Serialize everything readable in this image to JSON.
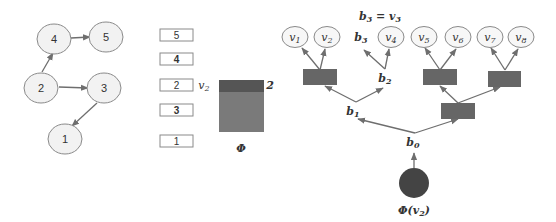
{
  "graph": {
    "nodes": [
      {
        "id": "1",
        "label": "1"
      },
      {
        "id": "2",
        "label": "2"
      },
      {
        "id": "3",
        "label": "3"
      },
      {
        "id": "4",
        "label": "4"
      },
      {
        "id": "5",
        "label": "5"
      }
    ],
    "edges": [
      {
        "from": "2",
        "to": "4"
      },
      {
        "from": "4",
        "to": "5"
      },
      {
        "from": "2",
        "to": "3"
      },
      {
        "from": "3",
        "to": "1"
      }
    ]
  },
  "stack": {
    "items": [
      "5",
      "4",
      "2",
      "3",
      "1"
    ],
    "bold_items": [
      "4",
      "3"
    ]
  },
  "embedding": {
    "row_label": "v2",
    "row_label_sub": "2",
    "row_index": "2",
    "matrix_label": "Φ",
    "colors": {
      "highlight_row": "#555555",
      "matrix": "#7a7a7a"
    }
  },
  "tree": {
    "annotation": "b3 = v3",
    "annotation_parts": {
      "lhs": "b",
      "lhs_sub": "3",
      "eq": " = ",
      "rhs": "v",
      "rhs_sub": "3"
    },
    "leaves": [
      {
        "label": "v",
        "sub": "1"
      },
      {
        "label": "v",
        "sub": "2"
      },
      {
        "label": "b",
        "sub": "3",
        "oval": false
      },
      {
        "label": "v",
        "sub": "4"
      },
      {
        "label": "v",
        "sub": "5"
      },
      {
        "label": "v",
        "sub": "6"
      },
      {
        "label": "v",
        "sub": "7"
      },
      {
        "label": "v",
        "sub": "8"
      }
    ],
    "branch_labels": [
      {
        "label": "b",
        "sub": "2"
      },
      {
        "label": "b",
        "sub": "1"
      },
      {
        "label": "b",
        "sub": "0"
      }
    ],
    "root_label": "Φ(v2)",
    "root_label_parts": {
      "phi": "Φ",
      "open": "(",
      "v": "v",
      "sub": "2",
      "close": ")"
    },
    "colors": {
      "inner_node": "#666666",
      "root": "#444444",
      "edge": "#6e6e6e"
    }
  }
}
